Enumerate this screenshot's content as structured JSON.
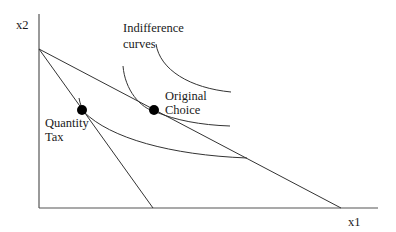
{
  "diagram": {
    "axes": {
      "x_label": "x1",
      "y_label": "x2"
    },
    "labels": {
      "indifference_line1": "Indifference",
      "indifference_line2": "curves",
      "original_line1": "Original",
      "original_line2": "Choice",
      "quantity_line1": "Quantity",
      "quantity_line2": "Tax"
    },
    "points": {
      "original_choice": {
        "x": 154,
        "y": 110
      },
      "quantity_tax": {
        "x": 82,
        "y": 110
      }
    },
    "colors": {
      "line": "#333333",
      "axis": "#555555",
      "dot": "#000000",
      "background": "#ffffff"
    }
  }
}
